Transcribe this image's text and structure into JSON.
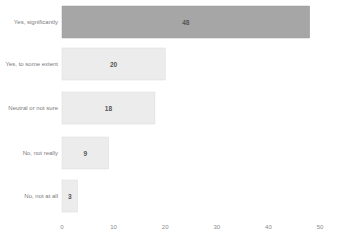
{
  "chart_data": {
    "type": "bar",
    "orientation": "horizontal",
    "title": "",
    "xlabel": "",
    "ylabel": "",
    "categories": [
      "Yes, significantly",
      "Yes, to some extent",
      "Neutral or not sure",
      "No, not really",
      "No, not at all"
    ],
    "values": [
      48,
      20,
      18,
      9,
      3
    ],
    "value_labels": [
      "48",
      "20",
      "18",
      "9",
      "3"
    ],
    "xlim": [
      0,
      50
    ],
    "xticks": [
      0,
      10,
      20,
      30,
      40,
      50
    ],
    "xtick_labels": [
      "0",
      "10",
      "20",
      "30",
      "40",
      "50"
    ],
    "grid": false,
    "legend": "none",
    "colors": {
      "highlight_bar": "#a6a6a6",
      "bar": "#ececec",
      "bar_border": "#d9d9d9",
      "category_text": "#7a7a7a",
      "value_text": "#555555",
      "tick_text": "#8a8a8a"
    },
    "highlight_index": 0
  }
}
